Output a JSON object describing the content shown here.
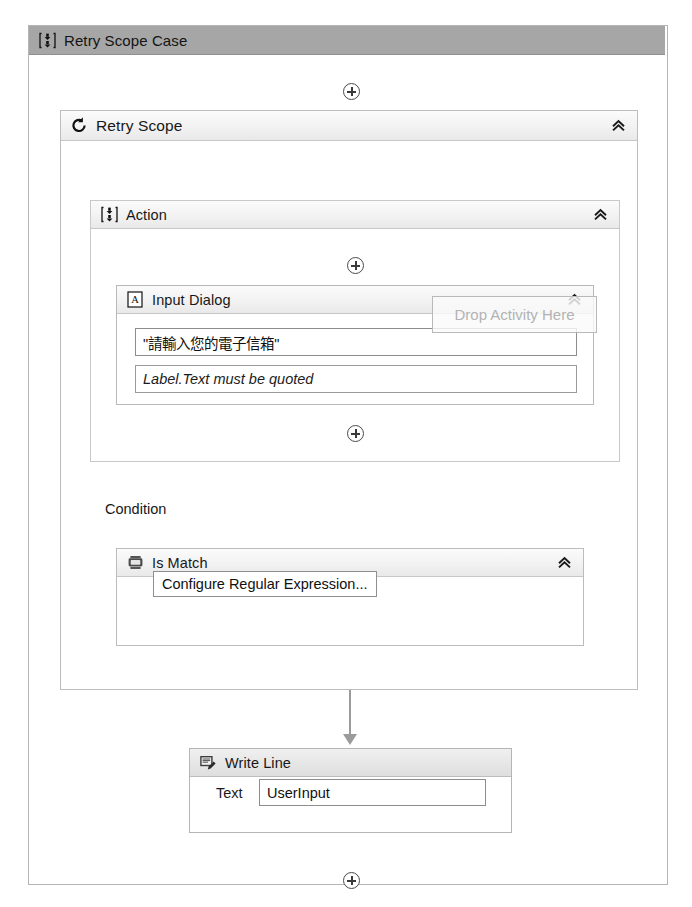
{
  "root": {
    "title": "Retry Scope Case",
    "icon": "sequence-icon"
  },
  "retry_scope": {
    "title": "Retry Scope",
    "icon": "retry-loop-icon",
    "collapse_icon": "chevron-double-up-icon",
    "top_plus": "add-activity-icon",
    "condition_label": "Condition"
  },
  "action": {
    "title": "Action",
    "icon": "sequence-icon",
    "collapse_icon": "chevron-double-up-icon",
    "top_plus": "add-activity-icon",
    "bottom_plus": "add-activity-icon"
  },
  "input_dialog": {
    "title": "Input Dialog",
    "icon": "text-document-a-icon",
    "collapse_icon": "chevron-double-up-icon",
    "title_field_value": "\"請輸入您的電子信箱\"",
    "label_field_placeholder": "Label.Text must be quoted"
  },
  "drop_overlay": {
    "text": "Drop Activity Here"
  },
  "is_match": {
    "title": "Is Match",
    "icon": "regex-chip-icon",
    "collapse_icon": "chevron-double-up-icon",
    "configure_button_label": "Configure Regular Expression..."
  },
  "write_line": {
    "title": "Write Line",
    "icon": "write-line-icon",
    "text_label": "Text",
    "text_value": "UserInput",
    "bottom_plus": "add-activity-icon"
  },
  "connector": {
    "arrow_icon": "flow-arrow-down-icon"
  },
  "colors": {
    "root_header_bg": "#a6a6a6",
    "panel_header_bg": "#f2f2f2",
    "border": "#bdbdbd",
    "placeholder_text": "#b3b3b3",
    "connector": "#9b9b9b"
  }
}
